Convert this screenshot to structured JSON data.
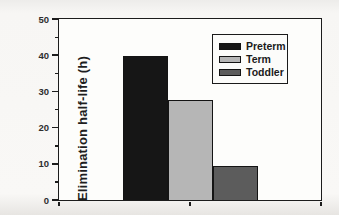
{
  "chart_data": {
    "type": "bar",
    "title": "",
    "xlabel": "",
    "ylabel": "Elimination half-life (h)",
    "ylim": [
      0,
      50
    ],
    "yticks": [
      0,
      10,
      20,
      30,
      40,
      50
    ],
    "minor_yticks": [
      5,
      15,
      25,
      35,
      45
    ],
    "categories": [
      "Preterm",
      "Term",
      "Toddler"
    ],
    "values": [
      39.8,
      27.6,
      9.5
    ],
    "bar_colors": [
      "#161616",
      "#b6b6b6",
      "#5c5c5c"
    ],
    "grid": false,
    "legend_position": "upper right",
    "legend_entries": [
      {
        "label": "Preterm",
        "color": "#161616"
      },
      {
        "label": "Term",
        "color": "#b6b6b6"
      },
      {
        "label": "Toddler",
        "color": "#5c5c5c"
      }
    ],
    "frame_color": "#1c1c1c"
  }
}
